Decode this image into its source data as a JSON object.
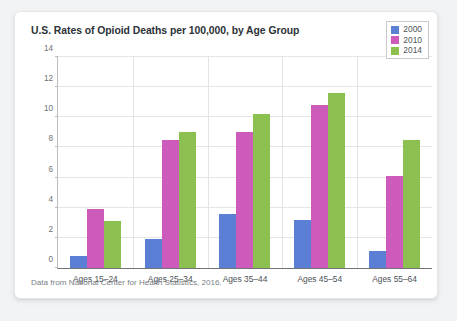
{
  "card": {
    "title": "U.S. Rates of Opioid Deaths per 100,000, by Age Group",
    "source_note": "Data from National Center for Health Statistics, 2016."
  },
  "chart_data": {
    "type": "bar",
    "title": "U.S. Rates of Opioid Deaths per 100,000, by Age Group",
    "xlabel": "",
    "ylabel": "",
    "ylim": [
      0,
      14
    ],
    "yticks": [
      0,
      2,
      4,
      6,
      8,
      10,
      12,
      14
    ],
    "grid": true,
    "legend_position": "top-right",
    "categories": [
      "Ages 15–24",
      "Ages 25–34",
      "Ages 35–44",
      "Ages 45–54",
      "Ages 55–64"
    ],
    "series": [
      {
        "name": "2000",
        "color": "#5b7fd4",
        "values": [
          0.8,
          1.9,
          3.6,
          3.2,
          1.1
        ]
      },
      {
        "name": "2010",
        "color": "#cc5bbb",
        "values": [
          3.9,
          8.5,
          9.0,
          10.8,
          6.1
        ]
      },
      {
        "name": "2014",
        "color": "#8cc152",
        "values": [
          3.1,
          9.0,
          10.2,
          11.6,
          8.5
        ]
      }
    ],
    "annotation": "Data from National Center for Health Statistics, 2016."
  }
}
